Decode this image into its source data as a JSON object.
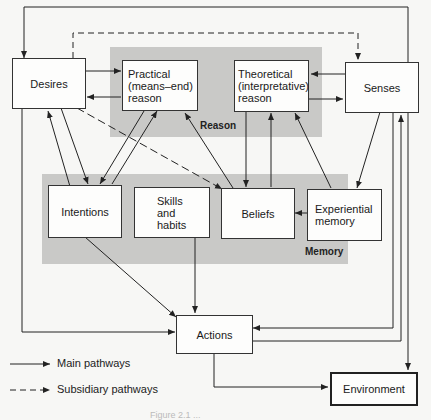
{
  "regions": {
    "reason": {
      "label": "Reason"
    },
    "memory": {
      "label": "Memory"
    }
  },
  "nodes": {
    "desires": {
      "label": "Desires"
    },
    "practical_reason": {
      "label": "Practical\n(means–end)\nreason"
    },
    "theoretical_reason": {
      "label": "Theoretical\n(interpretative)\nreason"
    },
    "senses": {
      "label": "Senses"
    },
    "intentions": {
      "label": "Intentions"
    },
    "skills_habits": {
      "label": "Skills\nand\nhabits"
    },
    "beliefs": {
      "label": "Beliefs"
    },
    "experiential_memory": {
      "label": "Experiential\nmemory"
    },
    "actions": {
      "label": "Actions"
    },
    "environment": {
      "label": "Environment"
    }
  },
  "legend": {
    "main": "Main pathways",
    "subsidiary": "Subsidiary pathways"
  },
  "caption": "Figure 2.1  ..."
}
